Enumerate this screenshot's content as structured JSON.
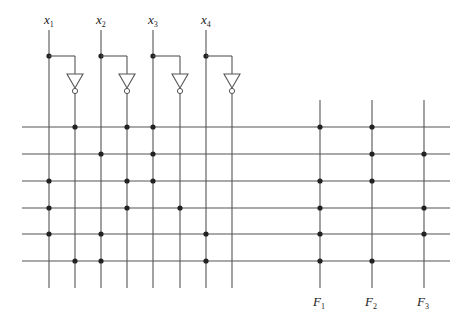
{
  "colors": {
    "line": "#555555",
    "dot": "#222222",
    "background": "#ffffff"
  },
  "inputs": [
    {
      "name": "x",
      "sub": "1",
      "x": 49
    },
    {
      "name": "x",
      "sub": "2",
      "x": 101
    },
    {
      "name": "x",
      "sub": "3",
      "x": 153
    },
    {
      "name": "x",
      "sub": "4",
      "x": 206
    }
  ],
  "outputs": [
    {
      "name": "F",
      "sub": "1",
      "x": 320
    },
    {
      "name": "F",
      "sub": "2",
      "x": 372
    },
    {
      "name": "F",
      "sub": "3",
      "x": 424
    }
  ],
  "columns_x": [
    49,
    75,
    101,
    127,
    153,
    180,
    206,
    232
  ],
  "columns_meaning": [
    "x1",
    "x1'",
    "x2",
    "x2'",
    "x3",
    "x3'",
    "x4",
    "x4'"
  ],
  "rows_y": [
    127,
    154,
    181,
    208,
    234,
    261
  ],
  "and_plane": [
    [
      1,
      3,
      4
    ],
    [
      2,
      4
    ],
    [
      0,
      3,
      4
    ],
    [
      0,
      3,
      5
    ],
    [
      0,
      2,
      6
    ],
    [
      1,
      2,
      6
    ]
  ],
  "or_plane": [
    [
      0,
      1
    ],
    [
      1,
      2
    ],
    [
      0,
      1
    ],
    [
      0,
      2
    ],
    [
      0,
      2
    ],
    [
      0,
      1
    ]
  ]
}
